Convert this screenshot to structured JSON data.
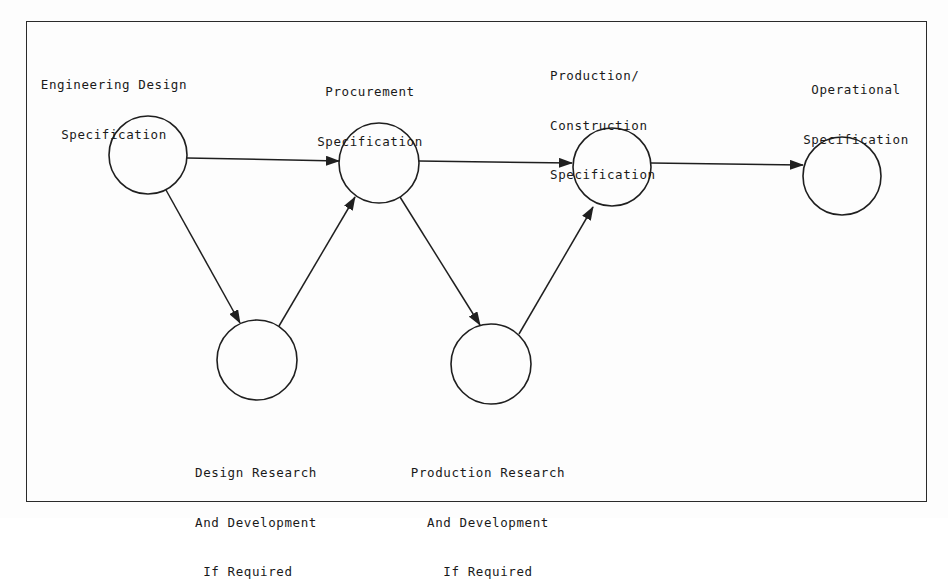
{
  "diagram": {
    "type": "specification-flow-network",
    "nodes": [
      {
        "id": "eng_design",
        "label_lines": [
          "Engineering Design",
          "Specification"
        ],
        "cx": 148,
        "cy": 155,
        "r": 39
      },
      {
        "id": "procurement",
        "label_lines": [
          "Procurement",
          "Specification"
        ],
        "cx": 379,
        "cy": 163,
        "r": 40
      },
      {
        "id": "production_construction",
        "label_lines": [
          "Production/",
          "Construction",
          "Specification"
        ],
        "cx": 612,
        "cy": 167,
        "r": 39
      },
      {
        "id": "operational",
        "label_lines": [
          "Operational",
          "Specification"
        ],
        "cx": 842,
        "cy": 176,
        "r": 39
      },
      {
        "id": "design_rd",
        "label_lines": [
          "Design Research",
          "And Development",
          " If Required"
        ],
        "cx": 257,
        "cy": 360,
        "r": 40
      },
      {
        "id": "production_rd",
        "label_lines": [
          "Production Research",
          "And Development",
          "If Required"
        ],
        "cx": 491,
        "cy": 364,
        "r": 40
      }
    ],
    "edges": [
      {
        "from": "eng_design",
        "to": "procurement"
      },
      {
        "from": "eng_design",
        "to": "design_rd"
      },
      {
        "from": "design_rd",
        "to": "procurement"
      },
      {
        "from": "procurement",
        "to": "production_construction"
      },
      {
        "from": "procurement",
        "to": "production_rd"
      },
      {
        "from": "production_rd",
        "to": "production_construction"
      },
      {
        "from": "production_construction",
        "to": "operational"
      }
    ],
    "colors": {
      "stroke": "#1f1f1f",
      "background": "#fdfdfd"
    }
  },
  "labels": {
    "eng_design": {
      "line1": "Engineering Design",
      "line2": "Specification"
    },
    "procurement": {
      "line1": "Procurement",
      "line2": "Specification"
    },
    "production_construction": {
      "line1": "Production/",
      "line2": "Construction",
      "line3": "Specification"
    },
    "operational": {
      "line1": "Operational",
      "line2": "Specification"
    },
    "design_rd": {
      "line1": "Design Research",
      "line2": "And Development",
      "line3": " If Required"
    },
    "production_rd": {
      "line1": "Production Research",
      "line2": "And Development",
      "line3": "If Required"
    }
  }
}
